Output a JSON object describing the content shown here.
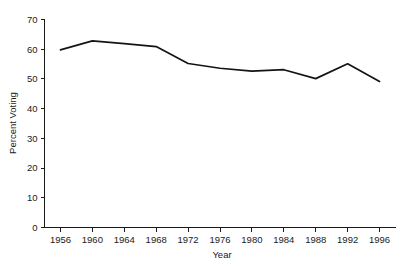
{
  "chart_data": {
    "type": "line",
    "title": "",
    "xlabel": "Year",
    "ylabel": "Percent Voting",
    "x": [
      1956,
      1960,
      1964,
      1968,
      1972,
      1976,
      1980,
      1984,
      1988,
      1992,
      1996
    ],
    "categories": [
      "1956",
      "1960",
      "1964",
      "1968",
      "1972",
      "1976",
      "1980",
      "1984",
      "1988",
      "1992",
      "1996"
    ],
    "values": [
      59.8,
      62.8,
      61.9,
      60.9,
      55.2,
      53.6,
      52.6,
      53.1,
      50.1,
      55.1,
      49.1
    ],
    "series": [
      {
        "name": "Percent Voting",
        "values": [
          59.8,
          62.8,
          61.9,
          60.9,
          55.2,
          53.6,
          52.6,
          53.1,
          50.1,
          55.1,
          49.1
        ]
      }
    ],
    "xlim": [
      1954,
      1998
    ],
    "ylim": [
      0,
      70
    ],
    "xticks": [
      1956,
      1960,
      1964,
      1968,
      1972,
      1976,
      1980,
      1984,
      1988,
      1992,
      1996
    ],
    "yticks": [
      0,
      10,
      20,
      30,
      40,
      50,
      60,
      70
    ],
    "xtick_labels": [
      "1956",
      "1960",
      "1964",
      "1968",
      "1972",
      "1976",
      "1980",
      "1984",
      "1988",
      "1992",
      "1996"
    ],
    "ytick_labels": [
      "0",
      "10",
      "20",
      "30",
      "40",
      "50",
      "60",
      "70"
    ],
    "grid": false,
    "legend": false,
    "legend_position": "none",
    "line_color": "#141414",
    "axis_color": "#1a1a1a",
    "background_color": "#ffffff"
  }
}
